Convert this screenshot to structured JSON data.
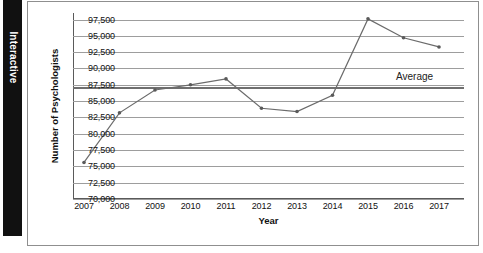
{
  "side_tab": {
    "label": "Interactive"
  },
  "chart_data": {
    "type": "line",
    "title": "",
    "xlabel": "Year",
    "ylabel": "Number of Psychologists",
    "categories": [
      "2007",
      "2008",
      "2009",
      "2010",
      "2011",
      "2012",
      "2013",
      "2014",
      "2015",
      "2016",
      "2017"
    ],
    "values": [
      75600,
      83200,
      86700,
      87500,
      88400,
      83900,
      83400,
      85900,
      97600,
      94700,
      93300
    ],
    "series": [
      {
        "name": "Number of Psychologists",
        "values": [
          75600,
          83200,
          86700,
          87500,
          88400,
          83900,
          83400,
          85900,
          97600,
          94700,
          93300
        ]
      }
    ],
    "ylim": [
      70000,
      98500
    ],
    "yticks": [
      70000,
      72500,
      75000,
      77500,
      80000,
      82500,
      85000,
      87500,
      90000,
      92500,
      95000,
      97500
    ],
    "ytick_labels": [
      "70,000",
      "72,500",
      "75,000",
      "77,500",
      "80,000",
      "82,500",
      "85,000",
      "87,500",
      "90,000",
      "92,500",
      "95,000",
      "97,500"
    ],
    "grid": true,
    "legend": "none",
    "annotations": [
      {
        "name": "average-line",
        "label": "Average",
        "value": 87100,
        "type": "hline"
      }
    ],
    "colors": {
      "line": "#6b6b6b",
      "marker": "#5a5a5a",
      "grid": "#9d9d9d",
      "average": "#6f6f6f"
    }
  }
}
